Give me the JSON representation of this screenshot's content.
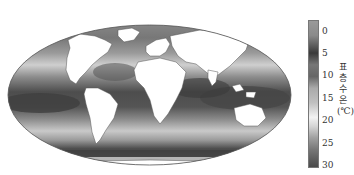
{
  "map": {
    "projection": "mollweide-like ellipse",
    "subject": "global sea surface temperature",
    "ocean_shading": "grayscale: light = cold (0°C), dark = warm (30°C)",
    "land_color": "#ffffff"
  },
  "colorbar": {
    "ticks": [
      "0",
      "5",
      "10",
      "15",
      "20",
      "25",
      "30"
    ],
    "label_chars": [
      "표",
      "층",
      "수",
      "온",
      "(℃)"
    ],
    "label": "표층 수온(℃)",
    "range": [
      0,
      30
    ]
  },
  "colors": {
    "cold": "#dcdcdc",
    "mid": "#a8a8a8",
    "warm": "#4a4a4a",
    "land": "#ffffff",
    "outline": "#555555"
  }
}
